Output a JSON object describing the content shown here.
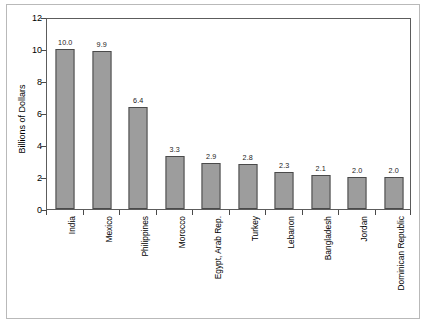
{
  "chart_data": {
    "type": "bar",
    "title": "",
    "subtitle": "",
    "xlabel": "",
    "ylabel": "Billions of Dollars",
    "ylim": [
      0,
      12
    ],
    "yticks": [
      0,
      2,
      4,
      6,
      8,
      10,
      12
    ],
    "ytick_labels": [
      "0",
      "2",
      "4",
      "6",
      "8",
      "10",
      "12"
    ],
    "grid": false,
    "legend": null,
    "bar_color": "#9d9d9d",
    "bar_edge_color": "#4a4a4a",
    "categories": [
      "India",
      "Mexico",
      "Philippines",
      "Morocco",
      "Egypt, Arab Rep.",
      "Turkey",
      "Lebanon",
      "Bangladesh",
      "Jordan",
      "Dominican Republic"
    ],
    "values": [
      10.0,
      9.9,
      6.4,
      3.3,
      2.9,
      2.8,
      2.3,
      2.1,
      2.0,
      2.0
    ],
    "data_labels": [
      "10.0",
      "9.9",
      "6.4",
      "3.3",
      "2.9",
      "2.8",
      "2.3",
      "2.1",
      "2.0",
      "2.0"
    ]
  }
}
